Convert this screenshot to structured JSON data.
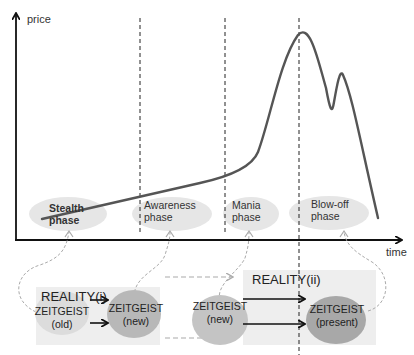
{
  "axes": {
    "y_label": "price",
    "x_label": "time"
  },
  "phases": [
    {
      "line1": "Stealth",
      "line2": "phase"
    },
    {
      "line1": "Awareness",
      "line2": "phase"
    },
    {
      "line1": "Mania",
      "line2": "phase"
    },
    {
      "line1": "Blow-off",
      "line2": "phase"
    }
  ],
  "reality_boxes": [
    {
      "label": "REALITY(i)"
    },
    {
      "label": "REALITY(ii)"
    }
  ],
  "zeitgeist_nodes": [
    {
      "line1": "ZEITGEIST",
      "line2": "(old)"
    },
    {
      "line1": "ZEITGEIST",
      "line2": "(new)"
    },
    {
      "line1": "ZEITGEIST",
      "line2": "(new)"
    },
    {
      "line1": "ZEITGEIST",
      "line2": "(present)"
    }
  ],
  "colors": {
    "axis": "#111111",
    "curve": "#555555",
    "phase_ellipse": "#e6e6e6",
    "reality_box": "#eeeeee",
    "zeitgeist_light": "#d0d0d0",
    "zeitgeist_dark": "#a8a8a8",
    "dashed_connector": "#aaaaaa"
  }
}
